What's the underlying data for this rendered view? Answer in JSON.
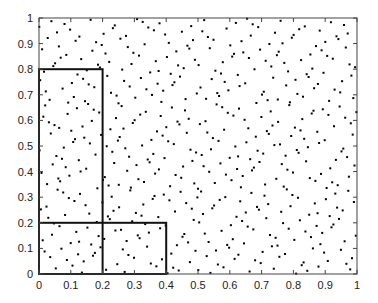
{
  "chart_data": {
    "type": "scatter",
    "title": "",
    "xlabel": "",
    "ylabel": "",
    "xlim": [
      0,
      1
    ],
    "ylim": [
      0,
      1
    ],
    "grid": false,
    "legend": null,
    "x_ticks": [
      "0",
      "0.1",
      "0.2",
      "0.3",
      "0.4",
      "0.5",
      "0.6",
      "0.7",
      "0.8",
      "0.9",
      "1"
    ],
    "y_ticks": [
      "0",
      "0.1",
      "0.2",
      "0.3",
      "0.4",
      "0.5",
      "0.6",
      "0.7",
      "0.8",
      "0.9",
      "1"
    ],
    "points": {
      "description": "Low-discrepancy point set in unit square (approx. Halton sequence, bases 2 and 3)",
      "count": 520,
      "bases": [
        2,
        3
      ],
      "skip": 1,
      "marker": "dot",
      "color": "#000000"
    },
    "rectangles": [
      {
        "name": "tall-box",
        "x0": 0,
        "y0": 0,
        "x1": 0.2,
        "y1": 0.8
      },
      {
        "name": "wide-box",
        "x0": 0,
        "y0": 0,
        "x1": 0.4,
        "y1": 0.2
      }
    ]
  },
  "colors": {
    "axis": "#444444",
    "rect": "#111111",
    "points": "#000000",
    "background": "#ffffff"
  }
}
